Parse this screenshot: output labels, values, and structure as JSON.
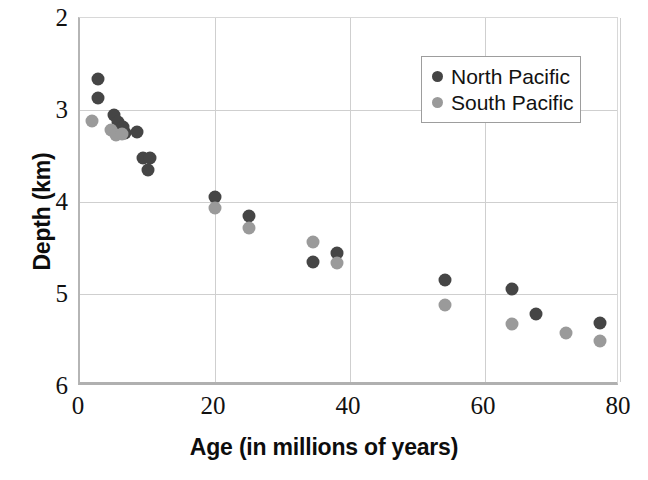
{
  "chart_data": {
    "type": "scatter",
    "title": "",
    "xlabel": "Age (in millions of years)",
    "ylabel": "Depth (km)",
    "xlim": [
      0,
      80
    ],
    "ylim": [
      2,
      6
    ],
    "y_inverted": true,
    "grid": true,
    "xticks": [
      "0",
      "20",
      "40",
      "60",
      "80"
    ],
    "xtick_values": [
      0,
      20,
      40,
      60,
      80
    ],
    "yticks": [
      "2",
      "3",
      "4",
      "5",
      "6"
    ],
    "ytick_values": [
      2,
      3,
      4,
      5,
      6
    ],
    "legend_position": "upper right",
    "series": [
      {
        "name": "North Pacific",
        "color": "#454545",
        "points": [
          {
            "x": 2.6,
            "y": 2.66
          },
          {
            "x": 2.6,
            "y": 2.87
          },
          {
            "x": 5.0,
            "y": 3.05
          },
          {
            "x": 5.6,
            "y": 3.13
          },
          {
            "x": 6.4,
            "y": 3.18
          },
          {
            "x": 6.6,
            "y": 3.25
          },
          {
            "x": 8.4,
            "y": 3.24
          },
          {
            "x": 9.4,
            "y": 3.52
          },
          {
            "x": 10.4,
            "y": 3.52
          },
          {
            "x": 10.0,
            "y": 3.65
          },
          {
            "x": 20.0,
            "y": 3.95
          },
          {
            "x": 25.0,
            "y": 4.15
          },
          {
            "x": 34.5,
            "y": 4.65
          },
          {
            "x": 38.0,
            "y": 4.55
          },
          {
            "x": 54.0,
            "y": 4.85
          },
          {
            "x": 64.0,
            "y": 4.95
          },
          {
            "x": 67.5,
            "y": 5.22
          },
          {
            "x": 77.0,
            "y": 5.32
          }
        ]
      },
      {
        "name": "South Pacific",
        "color": "#9a9a9a",
        "points": [
          {
            "x": 1.8,
            "y": 3.12
          },
          {
            "x": 4.6,
            "y": 3.22
          },
          {
            "x": 5.4,
            "y": 3.27
          },
          {
            "x": 6.2,
            "y": 3.26
          },
          {
            "x": 20.0,
            "y": 4.06
          },
          {
            "x": 25.0,
            "y": 4.28
          },
          {
            "x": 34.5,
            "y": 4.44
          },
          {
            "x": 38.0,
            "y": 4.66
          },
          {
            "x": 54.0,
            "y": 5.12
          },
          {
            "x": 64.0,
            "y": 5.33
          },
          {
            "x": 72.0,
            "y": 5.42
          },
          {
            "x": 77.0,
            "y": 5.51
          }
        ]
      }
    ]
  },
  "legend": {
    "entries": [
      {
        "label": "North Pacific",
        "swatch": "north-pacific-dot"
      },
      {
        "label": "South Pacific",
        "swatch": "south-pacific-dot"
      }
    ]
  },
  "axes": {
    "x_title": "Age (in millions of years)",
    "y_title": "Depth (km)"
  }
}
